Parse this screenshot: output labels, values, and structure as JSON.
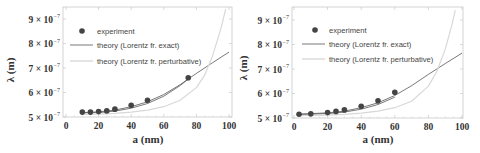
{
  "chart_data": [
    {
      "type": "scatter",
      "title": "",
      "xlabel": "a (nm)",
      "ylabel": "λ (m)",
      "xlim": [
        0,
        100
      ],
      "ylim": [
        5e-07,
        9.4e-07
      ],
      "x_ticks": [
        "0",
        "20",
        "40",
        "60",
        "80",
        "100"
      ],
      "y_ticks": [
        "5 × 10⁻⁷",
        "6 × 10⁻⁷",
        "7 × 10⁻⁷",
        "8 × 10⁻⁷",
        "9 × 10⁻⁷"
      ],
      "grid": false,
      "legend_position": "upper left",
      "legend": [
        "experiment",
        "theory (Lorentz fr. exact)",
        "theory (Lorentz fr. perturbative)"
      ],
      "series": [
        {
          "name": "experiment",
          "kind": "points",
          "x": [
            10,
            15,
            20,
            25,
            30,
            40,
            50,
            75
          ],
          "y": [
            5.2e-07,
            5.2e-07,
            5.22e-07,
            5.25e-07,
            5.32e-07,
            5.48e-07,
            5.68e-07,
            6.6e-07
          ]
        },
        {
          "name": "theory (Lorentz fr. exact)",
          "kind": "line",
          "x": [
            10,
            20,
            30,
            40,
            50,
            60,
            70,
            80,
            90,
            100
          ],
          "y": [
            5.18e-07,
            5.21e-07,
            5.28e-07,
            5.42e-07,
            5.62e-07,
            5.92e-07,
            6.32e-07,
            6.78e-07,
            7.22e-07,
            7.65e-07
          ]
        },
        {
          "name": "theory (Lorentz fr. exact) band",
          "kind": "line",
          "x": [
            10,
            20,
            30,
            40,
            50,
            60,
            70,
            75
          ],
          "y": [
            5.17e-07,
            5.18e-07,
            5.24e-07,
            5.36e-07,
            5.55e-07,
            5.85e-07,
            6.28e-07,
            6.55e-07
          ]
        },
        {
          "name": "theory (Lorentz fr. perturbative)",
          "kind": "line",
          "x": [
            10,
            20,
            30,
            40,
            50,
            60,
            70,
            80,
            85,
            90,
            95,
            98
          ],
          "y": [
            5.1e-07,
            5.12e-07,
            5.15e-07,
            5.2e-07,
            5.28e-07,
            5.42e-07,
            5.68e-07,
            6.2e-07,
            6.7e-07,
            7.5e-07,
            8.6e-07,
            9.4e-07
          ]
        }
      ]
    },
    {
      "type": "scatter",
      "title": "",
      "xlabel": "a (nm)",
      "ylabel": "λ (m)",
      "xlim": [
        0,
        100
      ],
      "ylim": [
        5e-07,
        9.4e-07
      ],
      "x_ticks": [
        "0",
        "20",
        "40",
        "60",
        "80",
        "100"
      ],
      "y_ticks": [
        "5 × 10⁻⁷",
        "6 × 10⁻⁷",
        "7 × 10⁻⁷",
        "8 × 10⁻⁷",
        "9 × 10⁻⁷"
      ],
      "grid": false,
      "legend_position": "upper left",
      "legend": [
        "experiment",
        "theory (Lorentz fr. exact)",
        "theory (Lorentz fr. perturbative)"
      ],
      "series": [
        {
          "name": "experiment",
          "kind": "points",
          "x": [
            3,
            10,
            20,
            25,
            30,
            40,
            50,
            60
          ],
          "y": [
            5.15e-07,
            5.17e-07,
            5.22e-07,
            5.27e-07,
            5.33e-07,
            5.48e-07,
            5.7e-07,
            6.05e-07
          ]
        },
        {
          "name": "theory (Lorentz fr. exact)",
          "kind": "line",
          "x": [
            3,
            10,
            20,
            30,
            40,
            50,
            60,
            70,
            80,
            90,
            100
          ],
          "y": [
            5.16e-07,
            5.18e-07,
            5.21e-07,
            5.28e-07,
            5.42e-07,
            5.62e-07,
            5.92e-07,
            6.32e-07,
            6.78e-07,
            7.22e-07,
            7.65e-07
          ]
        },
        {
          "name": "theory (Lorentz fr. exact) band",
          "kind": "line",
          "x": [
            3,
            10,
            20,
            30,
            40,
            50,
            60
          ],
          "y": [
            5.15e-07,
            5.16e-07,
            5.18e-07,
            5.24e-07,
            5.36e-07,
            5.55e-07,
            5.85e-07
          ]
        },
        {
          "name": "theory (Lorentz fr. perturbative)",
          "kind": "line",
          "x": [
            3,
            10,
            20,
            30,
            40,
            50,
            60,
            70,
            80,
            85,
            90,
            94,
            96
          ],
          "y": [
            5.1e-07,
            5.1e-07,
            5.12e-07,
            5.15e-07,
            5.2e-07,
            5.28e-07,
            5.42e-07,
            5.68e-07,
            6.3e-07,
            6.9e-07,
            7.8e-07,
            8.8e-07,
            9.4e-07
          ]
        }
      ]
    }
  ],
  "panels": [
    {
      "frame": {
        "x0px": 66,
        "x100px": 229,
        "left": 63,
        "right": 232,
        "top": 7,
        "bottom": 117
      },
      "legend_box": {
        "marker_x": 82,
        "marker_y": 31,
        "line_x1": 70,
        "line_x2": 93,
        "text_x": 97,
        "row_y": [
          31,
          45,
          61
        ]
      },
      "ylabel_pos": {
        "x": 14,
        "y": 70
      },
      "xlabel_pos": {
        "x": 148,
        "y": 143
      }
    },
    {
      "frame": {
        "x0px": 294,
        "x100px": 462,
        "left": 292,
        "right": 463,
        "top": 7,
        "bottom": 118
      },
      "legend_box": {
        "marker_x": 315,
        "marker_y": 30,
        "line_x1": 302,
        "line_x2": 325,
        "text_x": 329,
        "row_y": [
          30,
          44,
          59
        ]
      },
      "ylabel_pos": {
        "x": 247,
        "y": 68
      },
      "xlabel_pos": {
        "x": 378,
        "y": 143
      }
    }
  ],
  "colors": {
    "frame": "#c8c8c8",
    "tick_text": "#333333",
    "experiment": "#444444",
    "exact": "#555555",
    "perturbative": "#d8d8d8"
  }
}
